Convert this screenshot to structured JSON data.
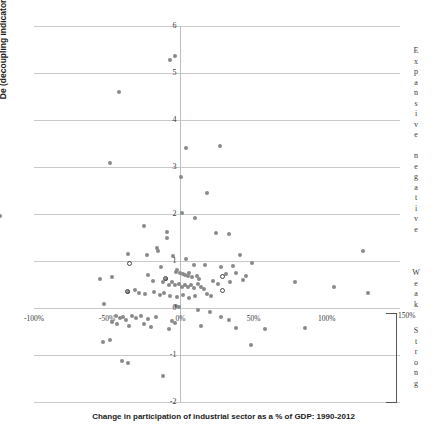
{
  "axes": {
    "y_title": "De (decoupling indicator)",
    "x_title": "Change in participation of industrial sector as a % of GDP: 1990-2012",
    "y_ticks": [
      "6",
      "5",
      "4",
      "3",
      "2",
      "1",
      "0",
      "-1",
      "-2"
    ],
    "x_ticks": [
      "-100%",
      "-50%",
      "0%",
      "50%",
      "100%"
    ],
    "x_tick_right": "150%"
  },
  "zones": {
    "expansive_negative": "Expansive negative",
    "weak": "Weak",
    "strong": "Strong"
  },
  "colors": {
    "marker_fill": "#8a8a8a",
    "marker_open_stroke": "#444444",
    "gridline": "#c9c9c9",
    "axis": "#bdbdbd",
    "text": "#3a3a3a"
  },
  "chart_data": {
    "type": "scatter",
    "title": "",
    "xlabel": "Change in participation of industrial sector as a % of GDP: 1990-2012",
    "ylabel": "De (decoupling indicator)",
    "xlim": [
      -100,
      150
    ],
    "ylim": [
      -2,
      6
    ],
    "grid": true,
    "legend": false,
    "x_tick_values": [
      -100,
      -50,
      0,
      50,
      100,
      150
    ],
    "y_tick_values": [
      -2,
      -1,
      0,
      1,
      2,
      3,
      4,
      5,
      6
    ],
    "annotations": [
      {
        "text": "Expansive negative",
        "orientation": "vertical",
        "region": "y > 1"
      },
      {
        "text": "Weak",
        "orientation": "vertical",
        "region": "0 < y < 1"
      },
      {
        "text": "Strong",
        "orientation": "vertical",
        "region": "y < 0"
      }
    ],
    "series": [
      {
        "name": "filled",
        "marker": "filled-circle",
        "color": "#8a8a8a",
        "points": [
          [
            -7,
            5.28
          ],
          [
            -4,
            5.37
          ],
          [
            -42,
            4.6
          ],
          [
            4,
            3.4
          ],
          [
            27,
            3.45
          ],
          [
            -48,
            3.08
          ],
          [
            0.5,
            2.78
          ],
          [
            18,
            2.45
          ],
          [
            -123,
            1.95
          ],
          [
            1,
            2.03
          ],
          [
            10,
            1.92
          ],
          [
            -25,
            1.75
          ],
          [
            -9,
            1.62
          ],
          [
            -9,
            1.48
          ],
          [
            24,
            1.6
          ],
          [
            33,
            1.58
          ],
          [
            -16,
            1.28
          ],
          [
            -15,
            1.22
          ],
          [
            -36,
            1.15
          ],
          [
            -23,
            1.12
          ],
          [
            -5,
            1.1
          ],
          [
            4,
            1.05
          ],
          [
            41,
            1.12
          ],
          [
            125,
            1.22
          ],
          [
            -13,
            0.88
          ],
          [
            9,
            0.92
          ],
          [
            17,
            0.92
          ],
          [
            28,
            0.88
          ],
          [
            36,
            0.9
          ],
          [
            49,
            0.95
          ],
          [
            -2,
            0.8
          ],
          [
            -3,
            0.76
          ],
          [
            0,
            0.74
          ],
          [
            2,
            0.72
          ],
          [
            3,
            0.7
          ],
          [
            5,
            0.68
          ],
          [
            6,
            0.74
          ],
          [
            8,
            0.66
          ],
          [
            11,
            0.68
          ],
          [
            13,
            0.62
          ],
          [
            31,
            0.72
          ],
          [
            38,
            0.74
          ],
          [
            45,
            0.68
          ],
          [
            -55,
            0.62
          ],
          [
            -47,
            0.66
          ],
          [
            -22,
            0.7
          ],
          [
            -19,
            0.58
          ],
          [
            -12,
            0.55
          ],
          [
            -10,
            0.62
          ],
          [
            -8,
            0.5
          ],
          [
            -6,
            0.55
          ],
          [
            -4,
            0.48
          ],
          [
            -1,
            0.52
          ],
          [
            1,
            0.45
          ],
          [
            3,
            0.5
          ],
          [
            5,
            0.44
          ],
          [
            7,
            0.48
          ],
          [
            9,
            0.42
          ],
          [
            12,
            0.52
          ],
          [
            14,
            0.45
          ],
          [
            16,
            0.4
          ],
          [
            22,
            0.58
          ],
          [
            26,
            0.52
          ],
          [
            34,
            0.55
          ],
          [
            43,
            0.6
          ],
          [
            78,
            0.55
          ],
          [
            105,
            0.45
          ],
          [
            128,
            0.32
          ],
          [
            -36,
            0.35
          ],
          [
            -31,
            0.38
          ],
          [
            -28,
            0.32
          ],
          [
            -24,
            0.3
          ],
          [
            -18,
            0.34
          ],
          [
            -14,
            0.28
          ],
          [
            -11,
            0.32
          ],
          [
            -7,
            0.26
          ],
          [
            -2,
            0.24
          ],
          [
            2,
            0.28
          ],
          [
            6,
            0.22
          ],
          [
            10,
            0.26
          ],
          [
            18,
            0.3
          ],
          [
            21,
            0.26
          ],
          [
            -52,
            0.08
          ],
          [
            -3,
            0.05
          ],
          [
            -1,
            0.02
          ],
          [
            12,
            -0.05
          ],
          [
            20,
            -0.08
          ],
          [
            -44,
            -0.18
          ],
          [
            -41,
            -0.22
          ],
          [
            -39,
            -0.2
          ],
          [
            -37,
            -0.26
          ],
          [
            -33,
            -0.16
          ],
          [
            -30,
            -0.22
          ],
          [
            -27,
            -0.18
          ],
          [
            -22,
            -0.24
          ],
          [
            -17,
            -0.2
          ],
          [
            -6,
            -0.28
          ],
          [
            -4,
            -0.32
          ],
          [
            28,
            -0.2
          ],
          [
            33,
            -0.26
          ],
          [
            -47,
            -0.3
          ],
          [
            -43,
            -0.34
          ],
          [
            -35,
            -0.38
          ],
          [
            -25,
            -0.34
          ],
          [
            -20,
            -0.4
          ],
          [
            -8,
            -0.45
          ],
          [
            14,
            -0.38
          ],
          [
            38,
            -0.42
          ],
          [
            58,
            -0.45
          ],
          [
            85,
            -0.42
          ],
          [
            -53,
            -0.72
          ],
          [
            -48,
            -0.68
          ],
          [
            48,
            -0.78
          ],
          [
            -40,
            -1.12
          ],
          [
            -36,
            -1.18
          ],
          [
            -12,
            -1.45
          ]
        ]
      },
      {
        "name": "hollow",
        "marker": "open-circle",
        "color": "#ffffff",
        "points": [
          [
            -35,
            0.95
          ],
          [
            -10,
            0.62
          ],
          [
            -36,
            0.35
          ],
          [
            29,
            0.66
          ],
          [
            29,
            0.38
          ]
        ]
      }
    ]
  }
}
